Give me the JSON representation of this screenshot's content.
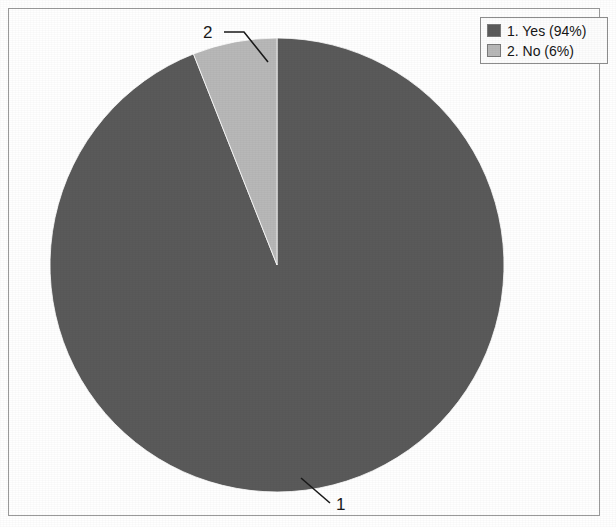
{
  "chart_data": {
    "type": "pie",
    "title": "",
    "categories": [
      "1. Yes",
      "2. No"
    ],
    "values": [
      94,
      6
    ],
    "value_unit": "%",
    "slices": [
      {
        "key": "1",
        "label": "1. Yes (94%)",
        "name": "Yes",
        "index_label": "1",
        "value": 94,
        "percent": "94%",
        "color": "#5a5a5a",
        "start_angle_deg": 0,
        "sweep_deg": 338.4
      },
      {
        "key": "2",
        "label": "2. No (6%)",
        "name": "No",
        "index_label": "2",
        "value": 6,
        "percent": "6%",
        "color": "#b8b8b8",
        "start_angle_deg": 338.4,
        "sweep_deg": 21.6
      }
    ],
    "legend": {
      "position": "top-right",
      "entries": [
        {
          "label": "1. Yes (94%)",
          "color": "#5a5a5a"
        },
        {
          "label": "2. No (6%)",
          "color": "#b8b8b8"
        }
      ]
    },
    "callout_labels": [
      {
        "text": "2",
        "points_to": "2. No (6%)"
      },
      {
        "text": "1",
        "points_to": "1. Yes (94%)"
      }
    ],
    "grid": false,
    "xlabel": "",
    "ylabel": ""
  },
  "colors": {
    "slice_yes": "#5a5a5a",
    "slice_no": "#b8b8b8",
    "frame_border": "#9a9a9a",
    "legend_border": "#8d8d8d",
    "background": "#ffffff",
    "text": "#161616",
    "leader_line": "#1a1a1a"
  },
  "geometry": {
    "pie_center_x": 277,
    "pie_center_y": 265,
    "pie_radius": 227
  }
}
